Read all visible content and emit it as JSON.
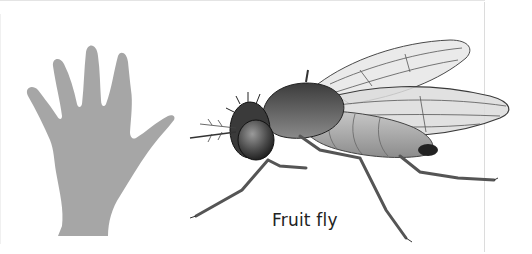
{
  "figure": {
    "caption": "Fruit fly",
    "subjects": [
      {
        "name": "hand-silhouette",
        "color": "#a6a6a6"
      },
      {
        "name": "fruit-fly-illustration",
        "color": "#3a3a3a"
      }
    ]
  }
}
